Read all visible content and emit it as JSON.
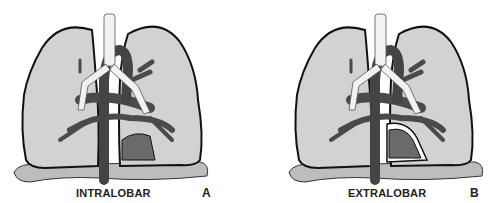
{
  "figure": {
    "panels": [
      {
        "id": "A",
        "caption": "INTRALOBAR",
        "letter": "A",
        "sequestration": "within lung pleura"
      },
      {
        "id": "B",
        "caption": "EXTRALOBAR",
        "letter": "B",
        "sequestration": "separate pleural covering"
      }
    ],
    "colors": {
      "lung_fill": "#d2d2d2",
      "outline": "#111111",
      "vessels": "#4a4a4a",
      "airway": "#f2f2f2",
      "diaphragm": "#bdbdbd",
      "sequestration": "#6a6a6a"
    }
  }
}
